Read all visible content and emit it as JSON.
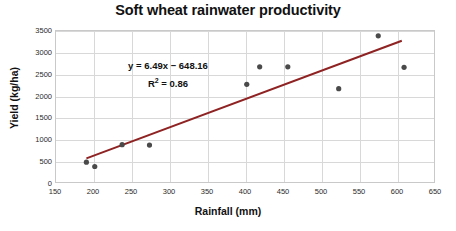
{
  "chart_data": {
    "type": "scatter",
    "title": "Soft wheat rainwater productivity",
    "xlabel": "Rainfall (mm)",
    "ylabel": "Yield (kg/ha)",
    "xlim": [
      150,
      650
    ],
    "ylim": [
      0,
      3500
    ],
    "xticks": [
      150,
      200,
      250,
      300,
      350,
      400,
      450,
      500,
      550,
      600,
      650
    ],
    "yticks": [
      0,
      500,
      1000,
      1500,
      2000,
      2500,
      3000,
      3500
    ],
    "grid": true,
    "legend": "none",
    "marker_color": "#4a4a4a",
    "trendline_color": "#8f2222",
    "x": [
      190,
      201,
      237,
      273,
      401,
      418,
      455,
      522,
      574,
      608
    ],
    "y": [
      500,
      400,
      900,
      890,
      2280,
      2680,
      2680,
      2180,
      3390,
      2670
    ],
    "points": [
      {
        "x": 190,
        "y": 500
      },
      {
        "x": 201,
        "y": 400
      },
      {
        "x": 237,
        "y": 900
      },
      {
        "x": 273,
        "y": 890
      },
      {
        "x": 401,
        "y": 2280
      },
      {
        "x": 418,
        "y": 2680
      },
      {
        "x": 455,
        "y": 2680
      },
      {
        "x": 522,
        "y": 2180
      },
      {
        "x": 574,
        "y": 3390
      },
      {
        "x": 608,
        "y": 2670
      }
    ],
    "trendline": {
      "slope": 6.49,
      "intercept": -648.16,
      "r_squared": 0.86,
      "x_start": 190,
      "x_end": 605
    },
    "annotations": {
      "equation": "y = 6.49x − 648.16",
      "r_squared_prefix": "R",
      "r_squared_exponent": "2",
      "r_squared_value": " = 0.86"
    }
  }
}
